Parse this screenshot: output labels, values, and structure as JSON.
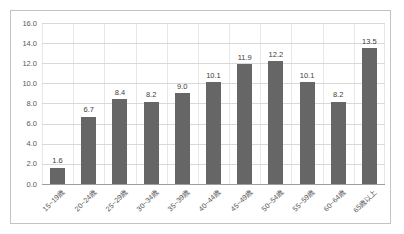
{
  "chart_data": {
    "type": "bar",
    "title": "",
    "xlabel": "",
    "ylabel": "",
    "categories": [
      "15~19歳",
      "20~24歳",
      "25~29歳",
      "30~34歳",
      "35~39歳",
      "40~44歳",
      "45~49歳",
      "50~54歳",
      "55~59歳",
      "60~64歳",
      "65歳以上"
    ],
    "values": [
      1.6,
      6.7,
      8.4,
      8.2,
      9.0,
      10.1,
      11.9,
      12.2,
      10.1,
      8.2,
      13.5
    ],
    "value_labels": [
      "1.6",
      "6.7",
      "8.4",
      "8.2",
      "9.0",
      "10.1",
      "11.9",
      "12.2",
      "10.1",
      "8.2",
      "13.5"
    ],
    "ylim": [
      0,
      16
    ],
    "ytick_interval": 2,
    "ytick_labels": [
      "0.0",
      "2.0",
      "4.0",
      "6.0",
      "8.0",
      "10.0",
      "12.0",
      "14.0",
      "16.0"
    ],
    "grid": true,
    "legend": false
  },
  "colors": {
    "bar": "#666666",
    "hgrid": "#d9d9d9",
    "vgrid": "#e7e7e7",
    "axis_line": "#9e9e9e",
    "tick_label": "#595959",
    "value_label": "#404040",
    "frame_border": "#c3c3c3",
    "background": "#ffffff"
  }
}
